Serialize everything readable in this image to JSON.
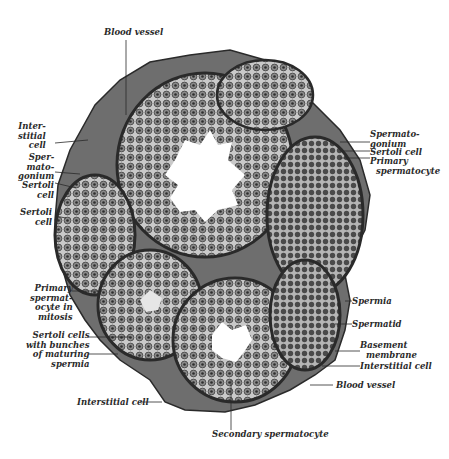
{
  "figure": {
    "labels": {
      "blood_vessel_top": "Blood vessel",
      "interstitial_cell_left": "Inter-\nstitial\ncell",
      "spermatogonium_left": "Sper-\nmato-\ngonium",
      "sertoli_cell_left_1": "Sertoli\ncell",
      "sertoli_cell_left_2": "Sertoli\ncell",
      "spermatogonium_right": "Spermato-\ngonium",
      "sertoli_cell_right": "Sertoli cell",
      "primary_spermatocyte_right": "Primary\n  spermatocyte",
      "primary_spermatocyte_mitosis": "Primary\nspermat-\nocyte in\nmitosis",
      "sertoli_cells_bunches": "Sertoli cells\nwith bunches\nof maturing\nspermia",
      "spermia": "Spermia",
      "spermatid": "Spermatid",
      "basement_membrane": "Basement\n  membrane",
      "interstitial_cell_right": "Interstitial cell",
      "blood_vessel_bottom": "Blood vessel",
      "interstitial_cell_bottom": "Interstitial cell",
      "secondary_spermatocyte": "Secondary spermatocyte"
    },
    "colors": {
      "background": "#ffffff",
      "tissue_dark": "#3a3a3a",
      "tissue_mid": "#7a7a7a",
      "tissue_light": "#cfcfcf",
      "lumen": "#ffffff",
      "text": "#2a2a2a"
    }
  }
}
